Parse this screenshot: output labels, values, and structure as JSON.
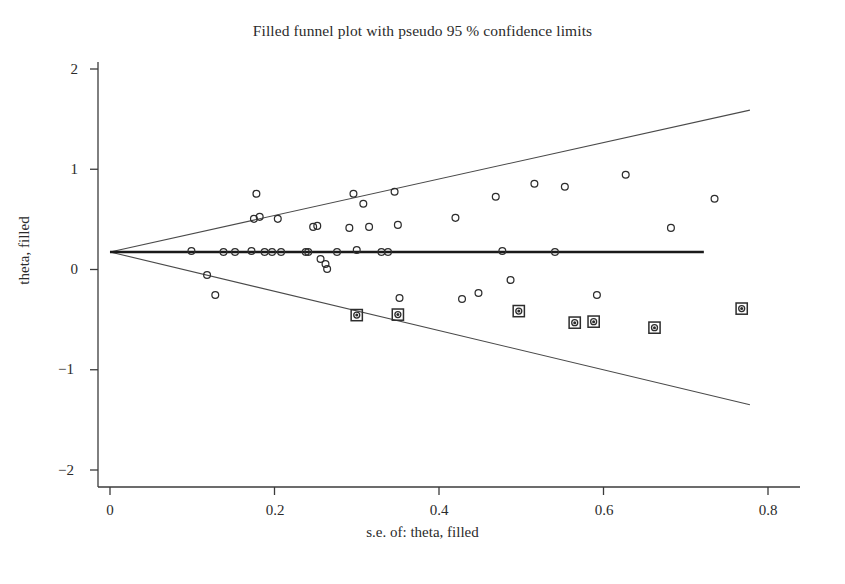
{
  "chart_data": {
    "type": "scatter",
    "title": "Filled funnel plot with pseudo 95 % confidence limits",
    "xlabel": "s.e. of: theta, filled",
    "ylabel": "theta, filled",
    "xlim": [
      0.0,
      0.8
    ],
    "ylim": [
      -2.0,
      2.0
    ],
    "grid": false,
    "legend": "none",
    "xticks": [
      "0",
      "0.2",
      "0.4",
      "0.6",
      "0.8"
    ],
    "xtick_values": [
      0,
      0.2,
      0.4,
      0.6,
      0.8
    ],
    "yticks": [
      "2",
      "1",
      "0",
      "−1",
      "−2"
    ],
    "ytick_values": [
      2,
      1,
      0,
      -1,
      -2
    ],
    "pooled_effect": 0.175,
    "effect_line": {
      "label": "pooled effect reference line",
      "y": 0.175,
      "x_start": 0.0,
      "x_end": 0.722
    },
    "confidence_limits": {
      "label": "pseudo 95 % confidence limits",
      "level": "95 %",
      "apex": [
        0.0,
        0.175
      ],
      "upper_end": [
        0.778,
        1.59
      ],
      "lower_end": [
        0.778,
        -1.35
      ]
    },
    "series": [
      {
        "name": "Observed studies",
        "marker": "open-circle",
        "points": [
          [
            0.099,
            0.185
          ],
          [
            0.118,
            -0.055
          ],
          [
            0.128,
            -0.255
          ],
          [
            0.138,
            0.175
          ],
          [
            0.152,
            0.175
          ],
          [
            0.172,
            0.185
          ],
          [
            0.175,
            0.505
          ],
          [
            0.178,
            0.755
          ],
          [
            0.182,
            0.525
          ],
          [
            0.188,
            0.175
          ],
          [
            0.197,
            0.175
          ],
          [
            0.204,
            0.505
          ],
          [
            0.208,
            0.175
          ],
          [
            0.238,
            0.175
          ],
          [
            0.241,
            0.175
          ],
          [
            0.247,
            0.425
          ],
          [
            0.252,
            0.435
          ],
          [
            0.256,
            0.105
          ],
          [
            0.262,
            0.055
          ],
          [
            0.264,
            0.005
          ],
          [
            0.276,
            0.175
          ],
          [
            0.291,
            0.415
          ],
          [
            0.296,
            0.755
          ],
          [
            0.3,
            0.195
          ],
          [
            0.308,
            0.655
          ],
          [
            0.315,
            0.425
          ],
          [
            0.33,
            0.175
          ],
          [
            0.338,
            0.175
          ],
          [
            0.346,
            0.775
          ],
          [
            0.35,
            0.445
          ],
          [
            0.352,
            -0.285
          ],
          [
            0.42,
            0.515
          ],
          [
            0.428,
            -0.295
          ],
          [
            0.448,
            -0.235
          ],
          [
            0.469,
            0.725
          ],
          [
            0.477,
            0.185
          ],
          [
            0.487,
            -0.105
          ],
          [
            0.516,
            0.855
          ],
          [
            0.541,
            0.175
          ],
          [
            0.553,
            0.825
          ],
          [
            0.592,
            -0.255
          ],
          [
            0.627,
            0.945
          ],
          [
            0.682,
            0.415
          ],
          [
            0.735,
            0.705
          ]
        ]
      },
      {
        "name": "Imputed (filled) studies",
        "marker": "boxed-circle",
        "points": [
          [
            0.3,
            -0.455
          ],
          [
            0.35,
            -0.45
          ],
          [
            0.497,
            -0.415
          ],
          [
            0.565,
            -0.53
          ],
          [
            0.588,
            -0.52
          ],
          [
            0.662,
            -0.58
          ],
          [
            0.768,
            -0.39
          ]
        ]
      }
    ]
  }
}
